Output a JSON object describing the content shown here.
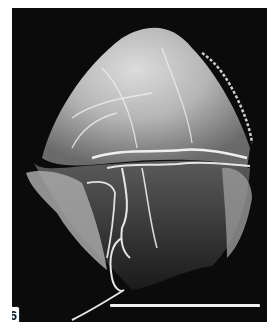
{
  "figure": {
    "panel_label": "6",
    "scale_bar": {
      "color": "#f2f2f2"
    },
    "colors": {
      "background": "#0b0b0b",
      "specimen_highlight": "#e8e8e8",
      "page": "#ffffff"
    }
  }
}
